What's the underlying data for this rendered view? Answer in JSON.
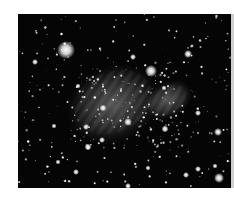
{
  "image": {
    "subject": "star field with diffuse nebula",
    "description": "Astronomical photograph: dense star field on black background with two faint gray nebulous patches near the center and several bright stars",
    "colors": {
      "sky": "#050505",
      "nebula": "#8a8a8a",
      "star": "#ffffff"
    }
  }
}
